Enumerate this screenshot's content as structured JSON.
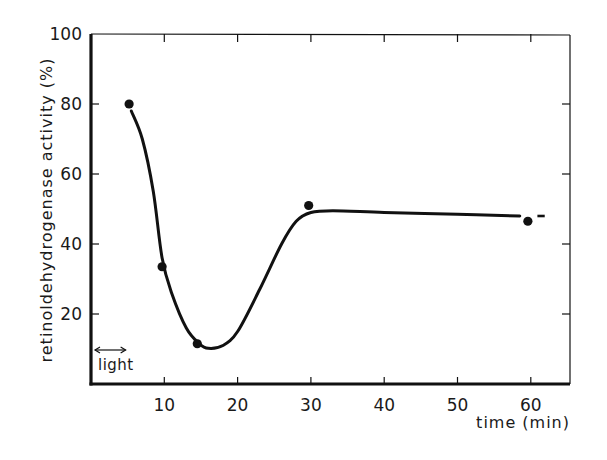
{
  "chart_data": {
    "type": "line",
    "title": "",
    "xlabel": "time (min)",
    "ylabel": "retinoldehydrogenase activity (%)",
    "xlim": [
      0,
      65
    ],
    "ylim": [
      0,
      100
    ],
    "x_ticks": [
      10,
      20,
      30,
      40,
      50,
      60
    ],
    "x_tick_labels": [
      "10",
      "20",
      "30",
      "40",
      "50",
      "60"
    ],
    "y_ticks": [
      20,
      40,
      60,
      80,
      100
    ],
    "y_tick_labels": [
      "20",
      "40",
      "60",
      "80",
      "100"
    ],
    "grid": false,
    "legend": null,
    "series": [
      {
        "name": "measured points",
        "kind": "scatter",
        "x": [
          5.2,
          9.7,
          14.5,
          29.7,
          59.6
        ],
        "y": [
          80,
          33.5,
          11.5,
          51,
          46.5
        ]
      },
      {
        "name": "fitted curve",
        "kind": "smooth-line",
        "x": [
          5.5,
          7,
          8.5,
          9.7,
          11,
          13,
          14.8,
          16,
          18,
          20,
          23,
          26,
          28,
          30,
          33,
          40,
          50,
          58.5
        ],
        "y": [
          78,
          70,
          55,
          36,
          26,
          16,
          11.5,
          10.2,
          11,
          15,
          27,
          40,
          46.5,
          49,
          49.5,
          49,
          48.5,
          48
        ]
      }
    ],
    "annotations": [
      {
        "text": "light",
        "x_range": [
          0,
          5
        ],
        "y": 10,
        "kind": "double-arrow"
      }
    ],
    "colors": {
      "line": "#111111",
      "marker": "#111111",
      "frame": "#111111"
    }
  }
}
